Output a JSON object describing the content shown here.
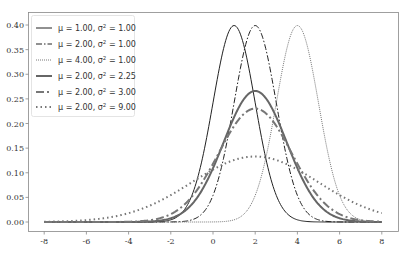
{
  "chart_data": {
    "type": "line",
    "title": "",
    "xlabel": "",
    "ylabel": "",
    "xlim": [
      -8.4,
      8.4
    ],
    "ylim": [
      -0.018,
      0.42
    ],
    "grid": false,
    "legend_position": "upper left",
    "x_ticks": [
      -8,
      -6,
      -4,
      -2,
      0,
      2,
      4,
      6,
      8
    ],
    "x_tick_labels": [
      "-8",
      "-6",
      "-4",
      "-2",
      "0",
      "2",
      "4",
      "6",
      "8"
    ],
    "y_ticks": [
      0.0,
      0.05,
      0.1,
      0.15,
      0.2,
      0.25,
      0.3,
      0.35,
      0.4
    ],
    "y_tick_labels": [
      "0.00",
      "0.05",
      "0.10",
      "0.15",
      "0.20",
      "0.25",
      "0.30",
      "0.35",
      "0.40"
    ],
    "x_range": [
      -8,
      8
    ],
    "series": [
      {
        "name": "μ = 1.00, σ² = 1.00",
        "mu": 1.0,
        "var": 1.0,
        "peak": 0.399,
        "color": "#222222",
        "width": 1.0,
        "dash": "",
        "opacity": 1
      },
      {
        "name": "μ = 2.00, σ² = 1.00",
        "mu": 2.0,
        "var": 1.0,
        "peak": 0.399,
        "color": "#222222",
        "width": 1.0,
        "dash": "6 2 1.5 2",
        "opacity": 1
      },
      {
        "name": "μ = 4.00, σ² = 1.00",
        "mu": 4.0,
        "var": 1.0,
        "peak": 0.399,
        "color": "#555555",
        "width": 0.8,
        "dash": "1 1",
        "opacity": 1
      },
      {
        "name": "μ = 2.00, σ² = 2.25",
        "mu": 2.0,
        "var": 2.25,
        "peak": 0.266,
        "color": "#666666",
        "width": 2.0,
        "dash": "",
        "opacity": 1
      },
      {
        "name": "μ = 2.00, σ² = 3.00",
        "mu": 2.0,
        "var": 3.0,
        "peak": 0.23,
        "color": "#777777",
        "width": 2.0,
        "dash": "8 3 2 3",
        "opacity": 1
      },
      {
        "name": "μ = 2.00, σ² = 9.00",
        "mu": 2.0,
        "var": 9.0,
        "peak": 0.133,
        "color": "#777777",
        "width": 2.0,
        "dash": "1.5 3",
        "opacity": 1
      }
    ]
  },
  "legend": {
    "items": [
      {
        "mu_text": "μ = 1.00, σ",
        "sup": "2",
        "rest": " = 1.00"
      },
      {
        "mu_text": "μ = 2.00, σ",
        "sup": "2",
        "rest": " = 1.00"
      },
      {
        "mu_text": "μ = 4.00, σ",
        "sup": "2",
        "rest": " = 1.00"
      },
      {
        "mu_text": "μ = 2.00, σ",
        "sup": "2",
        "rest": " = 2.25"
      },
      {
        "mu_text": "μ = 2.00, σ",
        "sup": "2",
        "rest": " = 3.00"
      },
      {
        "mu_text": "μ = 2.00, σ",
        "sup": "2",
        "rest": " = 9.00"
      }
    ]
  }
}
